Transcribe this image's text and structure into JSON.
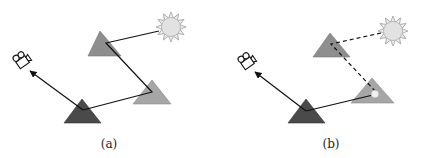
{
  "figure": {
    "panels": [
      {
        "label": "(a)",
        "path_style": "solid",
        "description": "Light path from sun bounces off two gray triangles, then the dark triangle, into the camera"
      },
      {
        "label": "(b)",
        "path_style": "dashed",
        "description": "Sun-to-surface path dashed; dark triangle connects to a shading point (small circle) on the right triangle; arrow to camera"
      }
    ],
    "colors": {
      "sun_fill": "#e4e4e4",
      "sun_stroke": "#9a9a9a",
      "triangle_upper": "#8e8e8e",
      "triangle_right": "#a6a6a6",
      "triangle_dark": "#4a4a4a",
      "line": "#111111"
    },
    "icons": [
      "sun-icon",
      "camera-icon"
    ]
  }
}
